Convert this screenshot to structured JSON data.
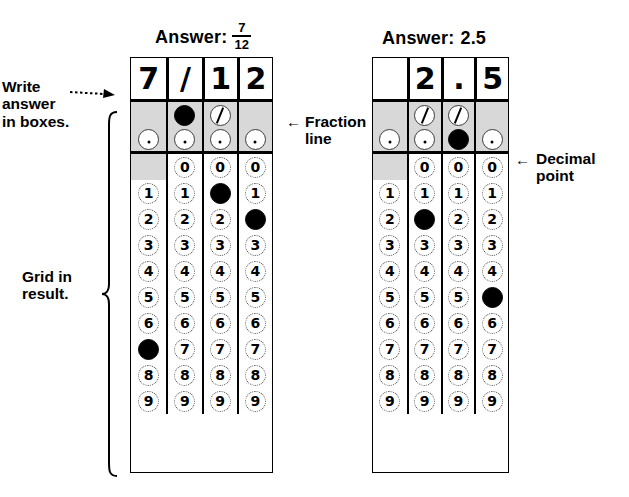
{
  "page": {
    "bg": "#ffffff",
    "shade_color": "#d8d8d8"
  },
  "annotations": {
    "write_answer": "Write\nanswer\nin boxes.",
    "grid_in_result": "Grid in\nresult.",
    "fraction_line": "Fraction\nline",
    "decimal_point": "Decimal\npoint",
    "arrow_left_glyph": "←",
    "arrow_dotted_name": "dotted-arrow"
  },
  "grids": [
    {
      "id": "fraction-grid",
      "answer_prefix": "Answer:",
      "answer_kind": "fraction",
      "answer_numerator": "7",
      "answer_denominator": "12",
      "answer_plain": "7/12",
      "write_row": [
        "7",
        "/",
        "1",
        "2"
      ],
      "fraction_row": [
        {
          "type": "none"
        },
        {
          "type": "filled"
        },
        {
          "type": "slash"
        },
        {
          "type": "none"
        }
      ],
      "decimal_row": [
        {
          "type": "dot"
        },
        {
          "type": "dot"
        },
        {
          "type": "dot"
        },
        {
          "type": "dot"
        }
      ],
      "digit_labels": [
        "0",
        "1",
        "2",
        "3",
        "4",
        "5",
        "6",
        "7",
        "8",
        "9"
      ],
      "zero_row_present": [
        false,
        true,
        true,
        true
      ],
      "filled_digits": [
        "7",
        null,
        "1",
        "2"
      ]
    },
    {
      "id": "decimal-grid",
      "answer_prefix": "Answer:",
      "answer_kind": "plain",
      "answer_numerator": "",
      "answer_denominator": "",
      "answer_plain": "2.5",
      "write_row": [
        "",
        "2",
        ".",
        "5"
      ],
      "fraction_row": [
        {
          "type": "none"
        },
        {
          "type": "slash"
        },
        {
          "type": "slash"
        },
        {
          "type": "none"
        }
      ],
      "decimal_row": [
        {
          "type": "dot"
        },
        {
          "type": "dot"
        },
        {
          "type": "filled"
        },
        {
          "type": "dot"
        }
      ],
      "digit_labels": [
        "0",
        "1",
        "2",
        "3",
        "4",
        "5",
        "6",
        "7",
        "8",
        "9"
      ],
      "zero_row_present": [
        false,
        true,
        true,
        true
      ],
      "filled_digits": [
        null,
        "2",
        null,
        "5"
      ]
    }
  ]
}
